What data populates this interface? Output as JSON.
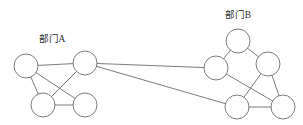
{
  "figure": {
    "type": "node-link-diagram",
    "width": 303,
    "height": 125,
    "background_color": "#ffffff",
    "stroke_color": "#5a5a5a",
    "node_fill_color": "#ffffff",
    "label_color": "#2b2b2b",
    "node_radius": 12
  },
  "clusters": [
    {
      "id": "A",
      "label": "部门A",
      "label_x": 52,
      "label_y": 42,
      "nodes": [
        {
          "id": "A1",
          "cx": 26,
          "cy": 66,
          "r": 12
        },
        {
          "id": "A2",
          "cx": 85,
          "cy": 63,
          "r": 12
        },
        {
          "id": "A3",
          "cx": 43,
          "cy": 105,
          "r": 12
        },
        {
          "id": "A4",
          "cx": 85,
          "cy": 105,
          "r": 12
        }
      ],
      "edges": [
        {
          "from": "A1",
          "to": "A2"
        },
        {
          "from": "A1",
          "to": "A3"
        },
        {
          "from": "A1",
          "to": "A4"
        },
        {
          "from": "A2",
          "to": "A3"
        },
        {
          "from": "A3",
          "to": "A4"
        }
      ]
    },
    {
      "id": "B",
      "label": "部门B",
      "label_x": 238,
      "label_y": 18,
      "nodes": [
        {
          "id": "B1",
          "cx": 238,
          "cy": 41,
          "r": 12
        },
        {
          "id": "B2",
          "cx": 216,
          "cy": 68,
          "r": 12
        },
        {
          "id": "B3",
          "cx": 268,
          "cy": 64,
          "r": 12
        },
        {
          "id": "B4",
          "cx": 237,
          "cy": 107,
          "r": 12
        },
        {
          "id": "B5",
          "cx": 283,
          "cy": 107,
          "r": 12
        }
      ],
      "edges": [
        {
          "from": "B1",
          "to": "B2"
        },
        {
          "from": "B1",
          "to": "B3"
        },
        {
          "from": "B2",
          "to": "B5"
        },
        {
          "from": "B3",
          "to": "B4"
        },
        {
          "from": "B3",
          "to": "B5"
        },
        {
          "from": "B4",
          "to": "B5"
        }
      ]
    }
  ],
  "bridge_edges": [
    {
      "from": "A2",
      "to": "B2",
      "x1": 85,
      "y1": 63,
      "x2": 216,
      "y2": 68
    },
    {
      "from": "A2",
      "to": "B4",
      "x1": 85,
      "y1": 63,
      "x2": 237,
      "y2": 107
    }
  ]
}
